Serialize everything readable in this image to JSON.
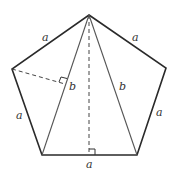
{
  "diagram": {
    "shape": "regular pentagon",
    "labels": {
      "side_top_left": "a",
      "side_top_right": "a",
      "side_left": "a",
      "side_right": "a",
      "side_bottom": "a",
      "diagonal_left": "b",
      "diagonal_right": "b"
    },
    "colors": {
      "outline": "#2a2a2a",
      "inner": "#555555"
    }
  }
}
